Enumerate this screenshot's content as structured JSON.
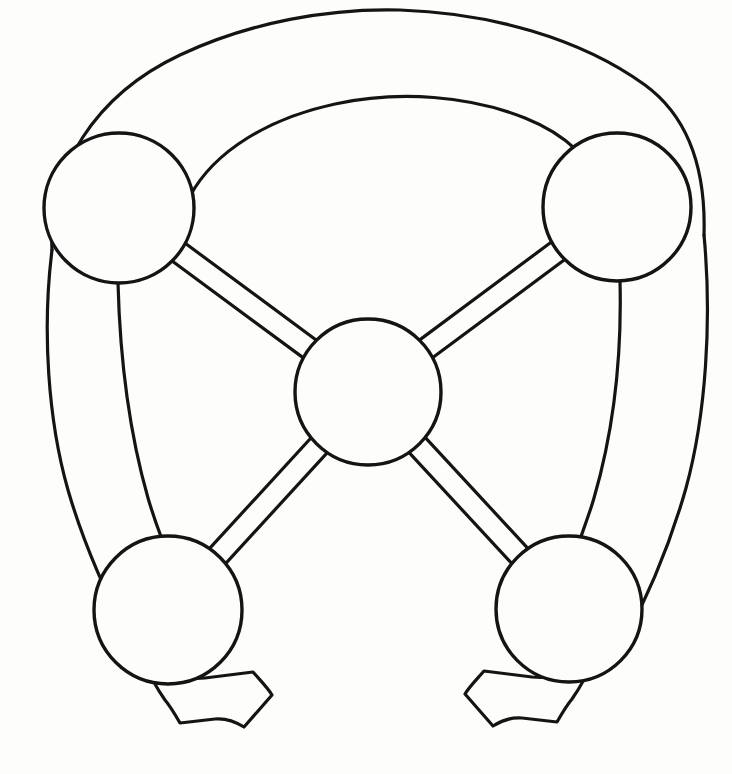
{
  "figure": {
    "kind": "line-art-diagram",
    "background_color": "#fdfdfc",
    "stroke_color": "#141414",
    "stroke_width": 3.2,
    "canvas": {
      "width": 732,
      "height": 774
    }
  },
  "nodes": [
    {
      "id": "hub",
      "label": "center-hub",
      "cx": 368,
      "cy": 392,
      "r": 73
    },
    {
      "id": "top-left",
      "label": "top-left-node",
      "cx": 119,
      "cy": 208,
      "r": 75
    },
    {
      "id": "top-right",
      "label": "top-right-node",
      "cx": 617,
      "cy": 207,
      "r": 74
    },
    {
      "id": "bottom-left",
      "label": "bottom-left-node",
      "cx": 168,
      "cy": 610,
      "r": 74
    },
    {
      "id": "bottom-right",
      "label": "bottom-right-node",
      "cx": 569,
      "cy": 609,
      "r": 73
    }
  ],
  "spokes": [
    {
      "id": "spoke-hub-top-left",
      "from": "hub",
      "to": "top-left",
      "band_width": 22
    },
    {
      "id": "spoke-hub-top-right",
      "from": "hub",
      "to": "top-right",
      "band_width": 22
    },
    {
      "id": "spoke-hub-bottom-left",
      "from": "hub",
      "to": "bottom-left",
      "band_width": 22
    },
    {
      "id": "spoke-hub-bottom-right",
      "from": "hub",
      "to": "bottom-right",
      "band_width": 22
    }
  ],
  "rims": [
    {
      "id": "rim-outer",
      "label": "outer-rim-band",
      "span": "bottom-left to top-left to top-right to bottom-right"
    },
    {
      "id": "rim-inner",
      "label": "inner-rim-band",
      "span": "top-left to top-right"
    }
  ],
  "feet": [
    {
      "id": "foot-left",
      "label": "bottom-left-foot",
      "attached_to": "bottom-left",
      "direction": "down-right"
    },
    {
      "id": "foot-right",
      "label": "bottom-right-foot",
      "attached_to": "bottom-right",
      "direction": "down-left"
    }
  ],
  "paths": {
    "rim_outer_top_upper": "M 52 250 C 48 170 95 95 180 55 C 250 22 330 8 400 10 C 490 13 580 38 645 85 C 690 118 706 170 704 235",
    "rim_outer_left_lower": "M 52 250 C 42 330 48 420 68 490 C 86 552 110 600 132 645",
    "rim_outer_right_lower": "M 704 235 C 712 320 706 415 686 488 C 668 552 645 602 622 645",
    "rim_inner_top": "M 190 196 C 215 150 270 118 335 104 C 400 90 470 96 525 118 C 570 136 594 164 604 194",
    "rim_inner_left_lower": "M 118 283 C 120 360 130 435 148 498 C 164 552 183 588 199 617",
    "rim_inner_right_lower": "M 620 281 C 622 360 612 436 594 498 C 578 552 560 587 544 615",
    "foot_left": "M 145 663 C 155 672 178 680 205 678 L 253 672 C 260 680 268 688 272 695 L 244 727 C 236 722 225 718 215 719 L 180 723 C 176 716 170 706 165 700 C 158 690 150 676 145 663 Z",
    "foot_right": "M 592 662 C 582 671 559 679 532 677 L 484 671 C 477 679 469 687 465 694 L 493 726 C 501 721 512 717 522 718 L 557 722 C 561 715 567 705 572 699 C 579 689 587 675 592 662 Z"
  }
}
